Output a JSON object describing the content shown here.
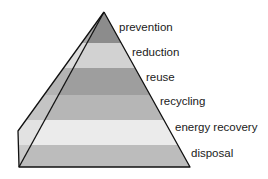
{
  "diagram": {
    "type": "pyramid",
    "title": "",
    "levels": [
      {
        "label": "prevention",
        "color": "#8c8c8c",
        "side_color": "#a8a8a8"
      },
      {
        "label": "reduction",
        "color": "#d2d2d2",
        "side_color": "#dcdcdc"
      },
      {
        "label": "reuse",
        "color": "#9e9e9e",
        "side_color": "#b4b4b4"
      },
      {
        "label": "recycling",
        "color": "#b6b6b6",
        "side_color": "#c4c4c4"
      },
      {
        "label": "energy recovery",
        "color": "#ebebeb",
        "side_color": "#e2e2e2"
      },
      {
        "label": "disposal",
        "color": "#bcbcbc",
        "side_color": "#cacaca"
      }
    ],
    "outline_color": "#111111"
  }
}
